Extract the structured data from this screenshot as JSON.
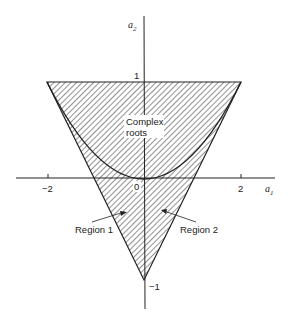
{
  "figure": {
    "type": "stability-triangle",
    "axes": {
      "x_label": "a",
      "x_label_sub": "1",
      "y_label": "a",
      "y_label_sub": "2",
      "x_ticks": [
        {
          "value": -2,
          "label": "−2"
        },
        {
          "value": 0,
          "label": "0"
        },
        {
          "value": 2,
          "label": "2"
        }
      ],
      "y_ticks": [
        {
          "value": 1,
          "label": "1"
        },
        {
          "value": -1,
          "label": "−1"
        }
      ]
    },
    "triangle_vertices": [
      [
        -2,
        1
      ],
      [
        2,
        1
      ],
      [
        0,
        -1
      ]
    ],
    "parabola": "a2 = a1^2 / 4",
    "labels": {
      "complex_line1": "Complex",
      "complex_line2": "roots",
      "region1": "Region 1",
      "region2": "Region 2"
    },
    "colors": {
      "line": "#222222",
      "hatch": "#555555",
      "background": "#ffffff"
    }
  }
}
